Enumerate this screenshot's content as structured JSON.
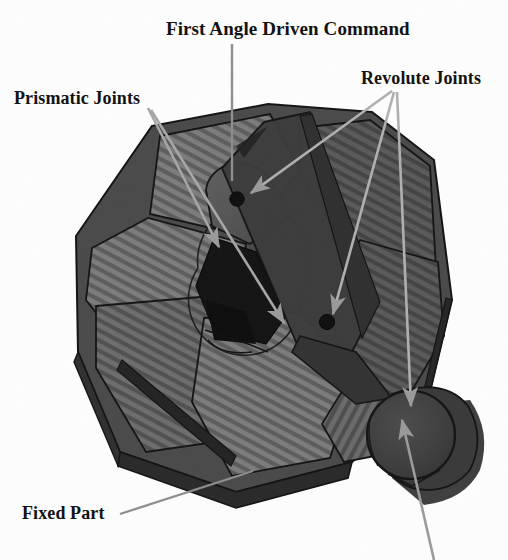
{
  "figure": {
    "kind": "engineering-cad-diagram",
    "background_color": "#fdfdfd",
    "render_style": "grayscale scanned line-art with hatched shading"
  },
  "labels": [
    {
      "id": "first-angle-driven-command",
      "text": "First Angle Driven Command",
      "x": 166,
      "y": 18,
      "leader_kind": "plain-line",
      "leader": [
        [
          232,
          44
        ],
        [
          232,
          181
        ]
      ]
    },
    {
      "id": "prismatic-joints",
      "text": "Prismatic Joints",
      "x": 14,
      "y": 88,
      "leader_kind": "arrow",
      "leader": [
        [
          148,
          108
        ],
        [
          223,
          251
        ]
      ],
      "leader2": [
        [
          150,
          110
        ],
        [
          288,
          327
        ]
      ]
    },
    {
      "id": "revolute-joints",
      "text": "Revolute Joints",
      "x": 361,
      "y": 68,
      "leader_kind": "arrow",
      "leader": [
        [
          393,
          91
        ],
        [
          247,
          196
        ]
      ],
      "leader2": [
        [
          394,
          92
        ],
        [
          330,
          318
        ]
      ],
      "leader3": [
        [
          396,
          92
        ],
        [
          411,
          411
        ]
      ]
    },
    {
      "id": "fixed-part",
      "text": "Fixed Part",
      "x": 22,
      "y": 503,
      "leader_kind": "plain-line",
      "leader": [
        [
          120,
          514
        ],
        [
          253,
          471
        ]
      ]
    }
  ],
  "cropped_leader": {
    "id": "bottom-cropped-callout",
    "note": "leader line runs off the bottom edge; its label text is not visible in the image",
    "leader": [
      [
        432,
        560
      ],
      [
        400,
        418
      ]
    ]
  },
  "colors": {
    "ink": "#111111",
    "leader_line": "#8e8e8e",
    "plate_light": "#8a8a8a",
    "plate_mid": "#6e6e6e",
    "plate_dark": "#4f4f4f",
    "plate_darker": "#3a3a3a",
    "cavity_black": "#141414",
    "disc_fill": "#3f3f3f",
    "disc_shadow": "#2e2e2e",
    "outline": "#1a1a1a",
    "hatch_stroke": "#4a4a4a"
  },
  "parts": [
    {
      "id": "base-plate-upper-left",
      "name": "hatched sector plate",
      "shading": "plate_mid"
    },
    {
      "id": "base-plate-left",
      "name": "hatched sector plate",
      "shading": "plate_mid"
    },
    {
      "id": "base-plate-lower-left",
      "name": "hatched sector plate",
      "shading": "plate_mid"
    },
    {
      "id": "base-plate-lower",
      "name": "hatched sector plate",
      "shading": "plate_mid"
    },
    {
      "id": "base-plate-right",
      "name": "hatched sector plate",
      "shading": "plate_dark"
    },
    {
      "id": "base-plate-upper-right",
      "name": "hatched sector plate",
      "shading": "plate_dark"
    },
    {
      "id": "linkage-bar",
      "name": "diagonal linkage bar",
      "shading": "plate_darker"
    },
    {
      "id": "round-boss",
      "name": "upper round boss",
      "shading": "plate_dark"
    },
    {
      "id": "central-cavity",
      "name": "central slot cavity",
      "shading": "cavity_black"
    },
    {
      "id": "rotary-disc",
      "name": "rotary disc / crank",
      "shading": "disc_fill"
    },
    {
      "id": "revolute-pin-upper",
      "name": "revolute pin hole",
      "cx": 237,
      "cy": 199,
      "r": 7
    },
    {
      "id": "revolute-pin-lower",
      "name": "revolute pin hole",
      "cx": 327,
      "cy": 322,
      "r": 7
    }
  ]
}
